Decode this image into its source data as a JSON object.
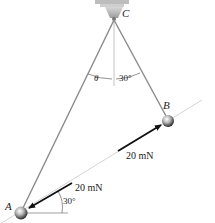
{
  "diagram": {
    "points": {
      "C": {
        "label": "C"
      },
      "B": {
        "label": "B"
      },
      "A": {
        "label": "A"
      }
    },
    "angles": {
      "theta": "θ",
      "at_C_right": "30°",
      "at_A": "30°"
    },
    "forces": {
      "on_B": "20 mN",
      "on_A": "20 mN"
    },
    "colors": {
      "cord": "#8a8a8a",
      "force_arrow": "#111111",
      "guide_line": "#d0d0d0",
      "sphere": "#9a9a9a"
    }
  }
}
